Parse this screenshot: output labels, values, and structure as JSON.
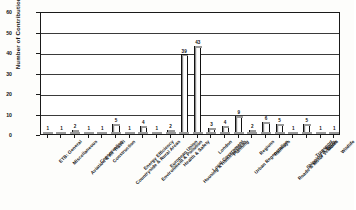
{
  "chart_data": {
    "type": "bar",
    "title": "",
    "xlabel": "",
    "ylabel": "Number of Contributions",
    "ylim": [
      0,
      60
    ],
    "yticks": [
      0,
      10,
      20,
      30,
      40,
      50,
      60
    ],
    "grid": true,
    "legend": "none",
    "categories": [
      "ETB: General",
      "Miscellaneous",
      "Aviation & Air Travel",
      "Conservation",
      "Construction",
      "Countryside & Rural Areas",
      "Energy Efficiency",
      "Environment & Pollution",
      "European Union",
      "Health & Safety",
      "Housing & Homelessness",
      "Local Government",
      "London",
      "Planning",
      "Urban Regeneration",
      "Regions",
      "Railways",
      "Roads & Motor Vehicles",
      "Shipping & Ports",
      "Transport",
      "Water",
      "Wildlife"
    ],
    "values": [
      1,
      1,
      2,
      1,
      1,
      5,
      1,
      4,
      1,
      2,
      39,
      43,
      3,
      4,
      9,
      2,
      6,
      5,
      1,
      5,
      1,
      1
    ],
    "value_labels": [
      "1",
      "1",
      "2",
      "1",
      "1",
      "5",
      "1",
      "4",
      "1",
      "2",
      "39",
      "43",
      "3",
      "4",
      "9",
      "2",
      "6",
      "5",
      "1",
      "5",
      "1",
      "1"
    ],
    "bar_face_color": "#ffffff",
    "bar_edge_color": "#111111",
    "axis_color": "#1a1a1a",
    "grid_color": "#3a3a3a"
  }
}
